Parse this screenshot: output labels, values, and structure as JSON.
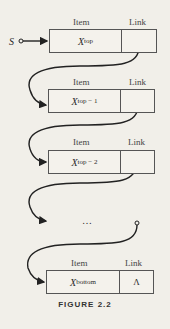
{
  "diagram": {
    "pointer_label": "S",
    "header_item": "Item",
    "header_link": "Link",
    "nodes": [
      {
        "item_base": "X",
        "item_sub": "top",
        "link": ""
      },
      {
        "item_base": "X",
        "item_sub": "top − 1",
        "link": ""
      },
      {
        "item_base": "X",
        "item_sub": "top − 2",
        "link": ""
      },
      {
        "item_base": "X",
        "item_sub": "bottom",
        "link": "Λ"
      }
    ],
    "ellipsis": "…",
    "caption": "FIGURE 2.2"
  }
}
